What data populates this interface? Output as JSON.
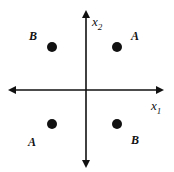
{
  "diagram": {
    "axes": {
      "x_label": "x",
      "x_sub": "1",
      "y_label": "x",
      "y_sub": "2"
    },
    "points": [
      {
        "quadrant": "top-left",
        "label": "B"
      },
      {
        "quadrant": "top-right",
        "label": "A"
      },
      {
        "quadrant": "bottom-left",
        "label": "A"
      },
      {
        "quadrant": "bottom-right",
        "label": "B"
      }
    ],
    "colors": {
      "ink": "#111111",
      "background": "#ffffff"
    }
  }
}
